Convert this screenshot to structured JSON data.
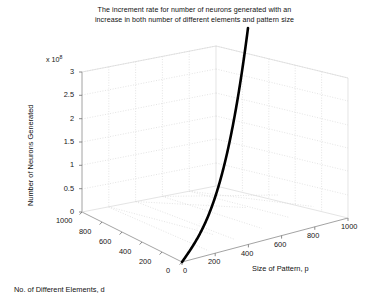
{
  "figure": {
    "background": "#ffffff",
    "width": 389,
    "height": 308
  },
  "title": {
    "line1": "The increment rate for number of neurons generated with an",
    "line2": "increase in both number of different elements and pattern size"
  },
  "axes": {
    "y": {
      "label": "Number of Neurons Generated",
      "exponent_prefix": "x 10",
      "exponent_power": "8",
      "ticks": [
        "0",
        "0.5",
        "1",
        "1.5",
        "2",
        "2.5",
        "3"
      ]
    },
    "x": {
      "label": "No. of Different Elements, d",
      "ticks": [
        "1000",
        "800",
        "600",
        "400",
        "200",
        "0"
      ]
    },
    "z": {
      "label": "Size of Pattern, p",
      "ticks": [
        "0",
        "200",
        "400",
        "600",
        "800",
        "1000"
      ]
    }
  },
  "style": {
    "curve_color": "#000000",
    "curve_width": 2.6,
    "grid_color": "#d8d8d8",
    "axis_color": "#8c8c8c",
    "tick_color": "#161616"
  },
  "chart_data": {
    "type": "line",
    "title": "The increment rate for number of neurons generated with an increase in both number of different elements and pattern size",
    "projection": "3d",
    "xlabel": "No. of Different Elements, d",
    "ylabel": "Number of Neurons Generated",
    "zlabel": "Size of Pattern, p",
    "xlim": [
      0,
      1000
    ],
    "ylim": [
      0,
      300000000
    ],
    "zlim": [
      0,
      1000
    ],
    "y_exponent": 100000000,
    "xticks": [
      0,
      200,
      400,
      600,
      800,
      1000
    ],
    "yticks": [
      0,
      50000000,
      100000000,
      150000000,
      200000000,
      250000000,
      300000000
    ],
    "ytick_labels": [
      "0",
      "0.5",
      "1",
      "1.5",
      "2",
      "2.5",
      "3"
    ],
    "zticks": [
      0,
      200,
      400,
      600,
      800,
      1000
    ],
    "grid": true,
    "legend": false,
    "series": [
      {
        "name": "Neurons generated",
        "color": "#000000",
        "d": [
          0,
          100,
          200,
          300,
          400,
          500,
          600,
          700,
          800,
          900,
          1000
        ],
        "p": [
          0,
          100,
          200,
          300,
          400,
          500,
          600,
          700,
          800,
          900,
          1000
        ],
        "neurons": [
          0,
          300000,
          2400000,
          8100000,
          19200000,
          37500000,
          64800000,
          102900000,
          153600000,
          218700000,
          300000000
        ]
      }
    ]
  }
}
